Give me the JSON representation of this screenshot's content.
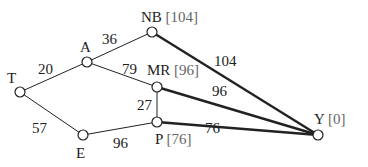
{
  "diagram": {
    "nodes": [
      {
        "id": "T",
        "label": "T",
        "heuristic": "",
        "x": 20,
        "y": 92,
        "lx": 7,
        "ly": 83
      },
      {
        "id": "A",
        "label": "A",
        "heuristic": "",
        "x": 87,
        "y": 62,
        "lx": 80,
        "ly": 52
      },
      {
        "id": "NB",
        "label": "NB",
        "heuristic": "[104]",
        "x": 152,
        "y": 32,
        "lx": 141,
        "ly": 22
      },
      {
        "id": "MR",
        "label": "MR",
        "heuristic": "[96]",
        "x": 157,
        "y": 87,
        "lx": 147,
        "ly": 75
      },
      {
        "id": "P",
        "label": "P",
        "heuristic": "[76]",
        "x": 157,
        "y": 122,
        "lx": 155,
        "ly": 144
      },
      {
        "id": "E",
        "label": "E",
        "heuristic": "",
        "x": 83,
        "y": 135,
        "lx": 76,
        "ly": 158
      },
      {
        "id": "Y",
        "label": "Y",
        "heuristic": "[0]",
        "x": 318,
        "y": 135,
        "lx": 314,
        "ly": 124
      }
    ],
    "edges": [
      {
        "from": "T",
        "to": "A",
        "weight": "20",
        "bold": false,
        "wx": 38,
        "wy": 74
      },
      {
        "from": "A",
        "to": "NB",
        "weight": "36",
        "bold": false,
        "wx": 102,
        "wy": 44
      },
      {
        "from": "A",
        "to": "MR",
        "weight": "79",
        "bold": false,
        "wx": 122,
        "wy": 74
      },
      {
        "from": "T",
        "to": "E",
        "weight": "57",
        "bold": false,
        "wx": 32,
        "wy": 133
      },
      {
        "from": "E",
        "to": "P",
        "weight": "96",
        "bold": false,
        "wx": 113,
        "wy": 148
      },
      {
        "from": "MR",
        "to": "P",
        "weight": "27",
        "bold": false,
        "wx": 137,
        "wy": 110
      },
      {
        "from": "NB",
        "to": "Y",
        "weight": "104",
        "bold": true,
        "wx": 214,
        "wy": 66
      },
      {
        "from": "MR",
        "to": "Y",
        "weight": "96",
        "bold": true,
        "wx": 212,
        "wy": 96
      },
      {
        "from": "P",
        "to": "Y",
        "weight": "76",
        "bold": true,
        "wx": 205,
        "wy": 133
      }
    ]
  }
}
